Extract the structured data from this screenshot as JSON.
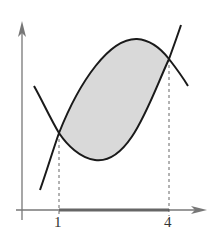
{
  "diagram": {
    "type": "area-between-curves",
    "x_axis": {
      "tick_labels": [
        "1",
        "4"
      ]
    },
    "intersections": [
      {
        "x_label": "1"
      },
      {
        "x_label": "4"
      }
    ],
    "colors": {
      "axis": "#777777",
      "curve": "#1a1a1a",
      "shade": "#d9d9d9",
      "interval": "#666666"
    }
  }
}
